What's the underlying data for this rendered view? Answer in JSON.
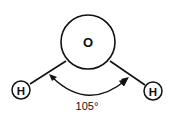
{
  "diagram": {
    "title": "",
    "molecule": "water",
    "atoms": [
      {
        "id": "O",
        "label": "O",
        "cx": 88,
        "cy": 42,
        "r": 27
      },
      {
        "id": "H1",
        "label": "H",
        "cx": 21,
        "cy": 90,
        "r": 9
      },
      {
        "id": "H2",
        "label": "H",
        "cx": 153,
        "cy": 91,
        "r": 9
      }
    ],
    "bonds": [
      {
        "from": "O",
        "to": "H1"
      },
      {
        "from": "O",
        "to": "H2"
      }
    ],
    "angle": {
      "value": "105",
      "unit": "°",
      "label": "105°"
    },
    "colors": {
      "stroke": "#111111",
      "background": "#ffffff"
    }
  }
}
